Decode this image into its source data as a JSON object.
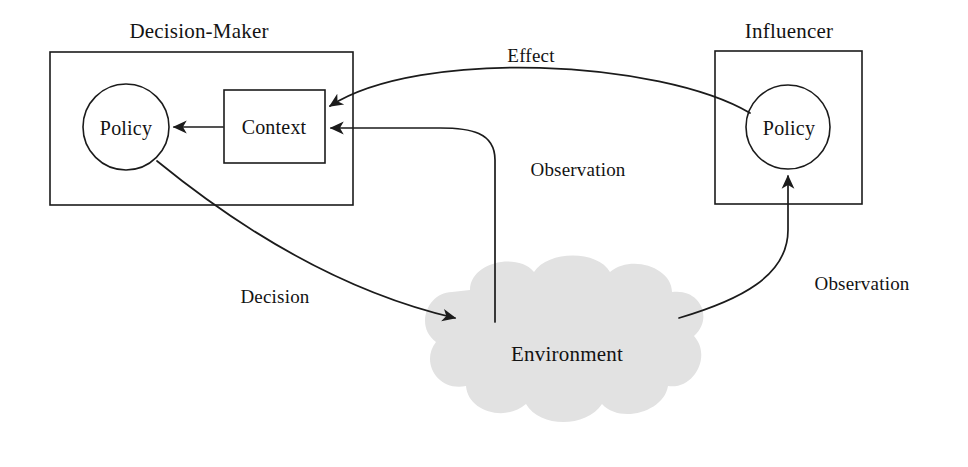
{
  "diagram": {
    "title_decision_maker": "Decision-Maker",
    "title_influencer": "Influencer",
    "nodes": {
      "dm_policy": "Policy",
      "dm_context": "Context",
      "inf_policy": "Policy",
      "environment": "Environment"
    },
    "edges": {
      "effect": "Effect",
      "observation_center": "Observation",
      "observation_right": "Observation",
      "decision": "Decision"
    },
    "colors": {
      "stroke": "#1b1b1b",
      "cloud_fill": "#e2e2e2",
      "background": "#ffffff",
      "text": "#131313"
    }
  }
}
